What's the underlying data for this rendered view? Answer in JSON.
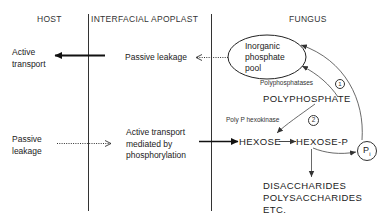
{
  "columns": {
    "host": "HOST",
    "apoplast": "INTERFACIAL APOPLAST",
    "fungus": "FUNGUS"
  },
  "host": {
    "active_transport": "Active\ntransport",
    "passive_leakage": "Passive\nleakage"
  },
  "apoplast": {
    "passive_leakage": "Passive leakage",
    "active_transport": "Active transport\nmediated by\nphosphorylation"
  },
  "fungus": {
    "pool": "Inorganic\nphosphate\npool",
    "polyphosphatases": "Polyphosphatases",
    "step1": "1",
    "polyphosphate": "POLYPHOSPHATE",
    "polyp_hexokinase": "Poly P hexokinase",
    "step2": "2",
    "hexose": "HEXOSE",
    "hexose_p": "HEXOSE-P",
    "pi": "P",
    "pi_sub": "i",
    "products": "DISACCHARIDES\nPOLYSACCHARIDES\nETC."
  },
  "colors": {
    "line": "#222222",
    "text": "#222222",
    "background": "#ffffff"
  }
}
